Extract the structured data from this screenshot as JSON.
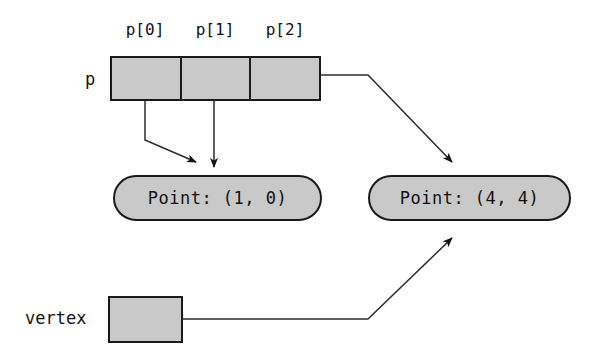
{
  "diagram": {
    "colors": {
      "fill": "#c9c9c9",
      "stroke": "#1a1a1a",
      "background": "#ffffff",
      "wire": "#2b2b2b"
    },
    "array": {
      "name": "p",
      "cell_labels": [
        "p[0]",
        "p[1]",
        "p[2]"
      ],
      "cell_count": 3
    },
    "objects": [
      {
        "id": "point-left",
        "text": "Point: (1, 0)"
      },
      {
        "id": "point-right",
        "text": "Point: (4, 4)"
      }
    ],
    "variable": {
      "name": "vertex"
    },
    "pointers": [
      {
        "from": "p[0]",
        "to": "Point: (1, 0)"
      },
      {
        "from": "p[1]",
        "to": "Point: (1, 0)"
      },
      {
        "from": "p[2]",
        "to": "Point: (4, 4)"
      },
      {
        "from": "vertex",
        "to": "Point: (4, 4)"
      }
    ]
  }
}
